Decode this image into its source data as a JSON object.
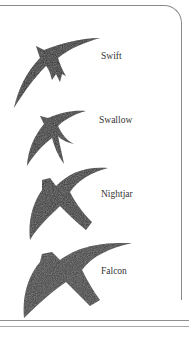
{
  "figure": {
    "birds": [
      {
        "name": "Swift"
      },
      {
        "name": "Swallow"
      },
      {
        "name": "Nightjar"
      },
      {
        "name": "Falcon"
      }
    ]
  },
  "colors": {
    "silhouette": "#2b2b2b",
    "frame": "#8a8a8a",
    "text": "#333333"
  }
}
